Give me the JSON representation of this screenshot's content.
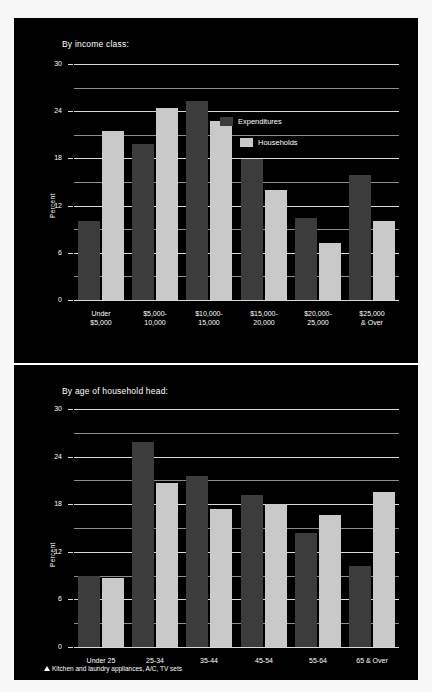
{
  "figure": {
    "footnote": "Kitchen and laundry appliances, A/C, TV sets",
    "footnote_marker": "triangle-marker",
    "background": "#000000",
    "colors": {
      "expenditures": "#3c3c3c",
      "households": "#c9c9c9",
      "grid": "#d9d9d9",
      "text": "#ffffff"
    }
  },
  "chart_data": [
    {
      "type": "bar",
      "title": "By income class:",
      "xlabel": "",
      "ylabel": "Percent",
      "ylim": [
        0,
        30
      ],
      "yticks": [
        0,
        6,
        12,
        18,
        24,
        30
      ],
      "ytick_labels": [
        "0",
        "6",
        "12",
        "18",
        "24",
        "30"
      ],
      "minor_gridlines": [
        3,
        9,
        15,
        21,
        27
      ],
      "grid": true,
      "legend_position": "inside-upper-right",
      "categories": [
        "Under\n$5,000",
        "$5,000-\n10,000",
        "$10,000-\n15,000",
        "$15,000-\n20,000",
        "$20,000-\n25,000",
        "$25,000\n& Over"
      ],
      "series": [
        {
          "name": "Expenditures",
          "color": "#3c3c3c",
          "values": [
            10.0,
            19.8,
            25.3,
            17.9,
            10.4,
            15.9
          ]
        },
        {
          "name": "Households",
          "color": "#c9c9c9",
          "values": [
            21.5,
            24.4,
            22.7,
            14.0,
            7.3,
            10.0
          ]
        }
      ]
    },
    {
      "type": "bar",
      "title": "By age of household head:",
      "xlabel": "",
      "ylabel": "Percent",
      "ylim": [
        0,
        30
      ],
      "yticks": [
        0,
        6,
        12,
        18,
        24,
        30
      ],
      "ytick_labels": [
        "0",
        "6",
        "12",
        "18",
        "24",
        "30"
      ],
      "minor_gridlines": [
        3,
        9,
        15,
        21,
        27
      ],
      "grid": true,
      "legend_position": "none",
      "categories": [
        "Under 25",
        "25-34",
        "35-44",
        "45-54",
        "55-64",
        "65 & Over"
      ],
      "series": [
        {
          "name": "Expenditures",
          "color": "#3c3c3c",
          "values": [
            9.0,
            25.8,
            21.5,
            19.1,
            14.4,
            10.2
          ]
        },
        {
          "name": "Households",
          "color": "#c9c9c9",
          "values": [
            8.7,
            20.7,
            17.4,
            18.0,
            16.6,
            19.6
          ]
        }
      ]
    }
  ]
}
